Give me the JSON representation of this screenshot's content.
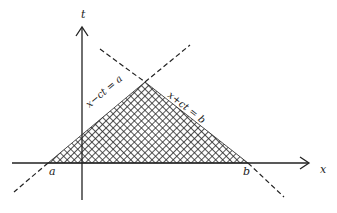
{
  "diagram": {
    "type": "characteristic-lines-domain-of-dependence",
    "axes": {
      "horizontal": {
        "label": "x"
      },
      "vertical": {
        "label": "t"
      }
    },
    "points": {
      "a": {
        "label": "a"
      },
      "b": {
        "label": "b"
      }
    },
    "lines": [
      {
        "id": "left-characteristic",
        "label": "x−ct = a",
        "style": "dashed"
      },
      {
        "id": "right-characteristic",
        "label": "x+ct = b",
        "style": "dashed"
      }
    ],
    "region": {
      "fill": "crosshatch",
      "vertices": [
        "a",
        "apex",
        "b"
      ]
    },
    "colors": {
      "ink": "#222222",
      "background": "#ffffff"
    }
  }
}
